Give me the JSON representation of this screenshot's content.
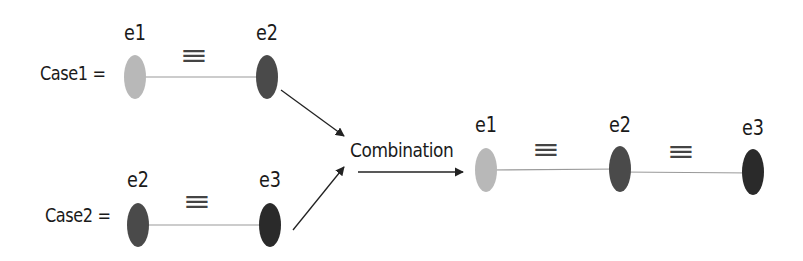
{
  "diagram": {
    "case1": {
      "label": "Case1 =",
      "nodes": [
        {
          "id": "e1",
          "label": "e1",
          "color": "#b8b8b8"
        },
        {
          "id": "e2",
          "label": "e2",
          "color": "#4a4a4a"
        }
      ],
      "relation": "≡"
    },
    "case2": {
      "label": "Case2 =",
      "nodes": [
        {
          "id": "e2",
          "label": "e2",
          "color": "#4a4a4a"
        },
        {
          "id": "e3",
          "label": "e3",
          "color": "#2a2a2a"
        }
      ],
      "relation": "≡"
    },
    "operation": {
      "label": "Combination"
    },
    "result": {
      "nodes": [
        {
          "id": "e1",
          "label": "e1",
          "color": "#b8b8b8"
        },
        {
          "id": "e2",
          "label": "e2",
          "color": "#4a4a4a"
        },
        {
          "id": "e3",
          "label": "e3",
          "color": "#2a2a2a"
        }
      ],
      "relations": [
        "≡",
        "≡"
      ]
    },
    "colors": {
      "edge": "#999999",
      "arrow": "#222222"
    }
  }
}
